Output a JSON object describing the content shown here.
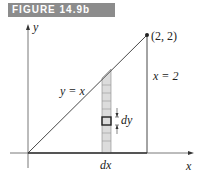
{
  "figure": {
    "title": "FIGURE 14.9b",
    "axis_x_label": "x",
    "axis_y_label": "y",
    "point_label": "(2, 2)",
    "line_label": "y = x",
    "vertical_line_label": "x = 2",
    "strip_width_label": "dx",
    "cell_height_label": "dy",
    "colors": {
      "banner": "#8c8c8c",
      "strip_fill": "#dcdcdc",
      "line": "#333333"
    }
  }
}
